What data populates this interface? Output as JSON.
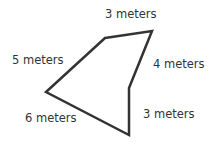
{
  "figure": {
    "shape": "pentagon",
    "stroke_color": "#333333",
    "vertices": [
      [
        105,
        38
      ],
      [
        152,
        31
      ],
      [
        129,
        88
      ],
      [
        129,
        135
      ],
      [
        46,
        92
      ]
    ],
    "sides": [
      {
        "label": "3 meters",
        "x": 105,
        "y": 18
      },
      {
        "label": "4 meters",
        "x": 153,
        "y": 68
      },
      {
        "label": "3 meters",
        "x": 143,
        "y": 118
      },
      {
        "label": "6 meters",
        "x": 25,
        "y": 122
      },
      {
        "label": "5 meters",
        "x": 12,
        "y": 64
      }
    ]
  }
}
